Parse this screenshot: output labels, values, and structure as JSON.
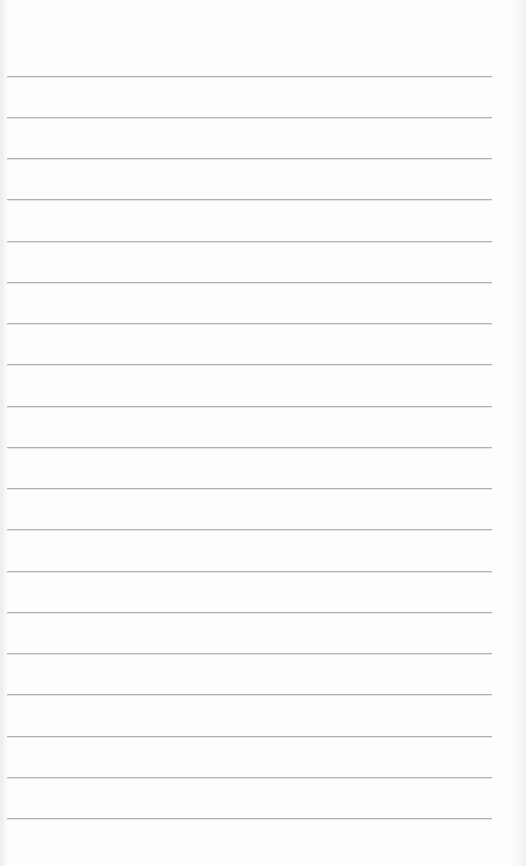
{
  "page": {
    "type": "blank lined paper",
    "background_color": "#fdfdfd",
    "rule_color": "#a9a9a9",
    "rule_count": 19,
    "rule_positions_y": [
      76,
      117,
      158,
      199,
      241,
      282,
      323,
      364,
      406,
      447,
      488,
      529,
      571,
      612,
      653,
      694,
      736,
      777,
      818
    ],
    "rule_left_x": 7,
    "rule_right_x": 492,
    "text_lines": []
  }
}
